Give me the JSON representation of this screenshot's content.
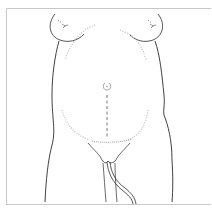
{
  "illustration": {
    "subject": "pregnant torso, front view, line drawing",
    "parts": [
      "frame",
      "left-breast",
      "right-breast",
      "left-torso-contour",
      "right-torso-contour",
      "uterus-fundus-outline",
      "umbilicus",
      "linea-nigra",
      "suprapubic-stipple",
      "thighs",
      "perineum",
      "catheter-tube"
    ]
  },
  "colors": {
    "background": "#ffffff",
    "frame": "#c8c8c8",
    "ink": "#2a2a2a",
    "stipple": "#bdbdbd"
  }
}
